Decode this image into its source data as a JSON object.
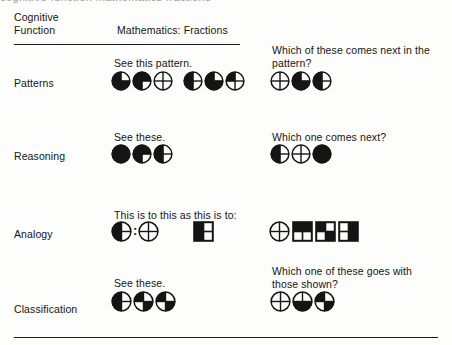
{
  "figure": {
    "clipped_top_text": "cognitive function mathematics fractions",
    "header": {
      "col1_line1": "Cognitive",
      "col1_line2": "Function",
      "col2": "Mathematics: Fractions"
    },
    "ink_color": "#151515",
    "rows": [
      {
        "label": "Patterns",
        "stem_prompt": "See this pattern.",
        "question_prompt": "Which of these comes next in the\npattern?",
        "stem_items": [
          {
            "shape": "circle",
            "parts": 4,
            "filled": [
              "tl",
              "bl",
              "br"
            ],
            "outlined": true
          },
          {
            "shape": "circle",
            "parts": 4,
            "filled": [
              "tl",
              "bl",
              "tr"
            ],
            "outlined": true
          },
          {
            "shape": "circle",
            "parts": 4,
            "filled": [],
            "outlined": true
          },
          {
            "shape": "circle",
            "parts": 4,
            "filled": [
              "tl",
              "bl"
            ],
            "outlined": true
          },
          {
            "shape": "circle",
            "parts": 4,
            "filled": [
              "tl",
              "bl",
              "br"
            ],
            "outlined": true
          },
          {
            "shape": "circle",
            "parts": 4,
            "filled": [
              "tl"
            ],
            "outlined": true
          }
        ],
        "option_items": [
          {
            "shape": "circle",
            "parts": 4,
            "filled": [],
            "outlined": true
          },
          {
            "shape": "circle",
            "parts": 4,
            "filled": [
              "tl",
              "bl",
              "br"
            ],
            "outlined": true
          },
          {
            "shape": "circle",
            "parts": 4,
            "filled": [
              "tl",
              "bl"
            ],
            "outlined": true
          }
        ]
      },
      {
        "label": "Reasoning",
        "stem_prompt": "See these.",
        "question_prompt": "Which one comes next?",
        "stem_items": [
          {
            "shape": "circle",
            "parts": 4,
            "filled": [
              "tl",
              "tr",
              "bl",
              "br"
            ],
            "outlined": true
          },
          {
            "shape": "circle",
            "parts": 4,
            "filled": [
              "tl",
              "tr",
              "bl"
            ],
            "outlined": true
          },
          {
            "shape": "circle",
            "parts": 4,
            "filled": [
              "tl",
              "bl"
            ],
            "outlined": true
          }
        ],
        "option_items": [
          {
            "shape": "circle",
            "parts": 4,
            "filled": [
              "tl",
              "bl"
            ],
            "outlined": true
          },
          {
            "shape": "circle",
            "parts": 4,
            "filled": [],
            "outlined": true
          },
          {
            "shape": "circle",
            "parts": 4,
            "filled": [
              "tl",
              "tr",
              "bl",
              "br"
            ],
            "outlined": true
          }
        ]
      },
      {
        "label": "Analogy",
        "stem_prompt": "This is to this as this is to:",
        "question_prompt": "",
        "stem_items": [
          {
            "shape": "circle",
            "parts": 4,
            "filled": [
              "tl",
              "bl"
            ],
            "outlined": true
          },
          {
            "shape": "separator",
            "text": ":"
          },
          {
            "shape": "circle",
            "parts": 4,
            "filled": [],
            "outlined": true
          },
          {
            "shape": "spacer",
            "width": 34
          },
          {
            "shape": "square",
            "parts": 4,
            "filled": [
              "tl",
              "bl"
            ],
            "outlined": true
          }
        ],
        "option_items": [
          {
            "shape": "circle",
            "parts": 4,
            "filled": [],
            "outlined": true
          },
          {
            "shape": "square",
            "parts": 4,
            "filled": [
              "tl",
              "tr"
            ],
            "outlined": true
          },
          {
            "shape": "square",
            "parts": 4,
            "filled": [
              "tl",
              "br"
            ],
            "outlined": true
          },
          {
            "shape": "square",
            "parts": 4,
            "filled": [
              "tr",
              "br"
            ],
            "outlined": true
          }
        ]
      },
      {
        "label": "Classification",
        "stem_prompt": "See these.",
        "question_prompt": "Which one of these goes with\nthose shown?",
        "stem_items": [
          {
            "shape": "circle",
            "parts": 4,
            "filled": [
              "tl",
              "bl"
            ],
            "outlined": true
          },
          {
            "shape": "circle",
            "parts": 4,
            "filled": [
              "tl",
              "br"
            ],
            "outlined": true
          },
          {
            "shape": "circle",
            "parts": 4,
            "filled": [
              "tl",
              "br"
            ],
            "outlined": true
          }
        ],
        "option_items": [
          {
            "shape": "circle",
            "parts": 4,
            "filled": [],
            "outlined": true
          },
          {
            "shape": "circle",
            "parts": 4,
            "filled": [
              "bl",
              "br"
            ],
            "outlined": true
          },
          {
            "shape": "circle",
            "parts": 4,
            "filled": [
              "tl",
              "br"
            ],
            "outlined": true
          }
        ]
      }
    ]
  }
}
